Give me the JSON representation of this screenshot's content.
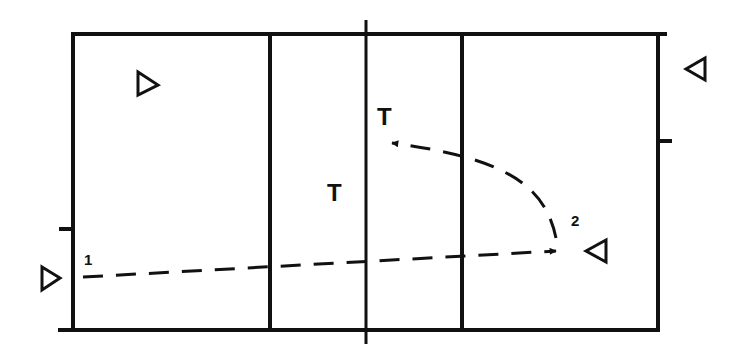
{
  "diagram": {
    "type": "volleyball-court-play",
    "colors": {
      "line": "#111111",
      "background": "#ffffff"
    },
    "labels": {
      "t_upper": "T",
      "t_lower": "T",
      "pos_1": "1",
      "pos_2": "2"
    },
    "players": [
      {
        "id": "left-back-player",
        "direction": "right",
        "x": 148,
        "y": 85
      },
      {
        "id": "left-server-player",
        "direction": "right",
        "x": 48,
        "y": 278
      },
      {
        "id": "right-player-2",
        "direction": "left",
        "x": 570,
        "y": 251
      },
      {
        "id": "right-outside-player",
        "direction": "left",
        "x": 694,
        "y": 69
      }
    ],
    "paths": [
      {
        "id": "pass-1-to-2",
        "from": "1",
        "to": "2",
        "style": "dashed-arrow"
      },
      {
        "id": "pass-2-to-T",
        "from": "2",
        "to": "T",
        "style": "dashed-curved-arrow"
      }
    ]
  }
}
